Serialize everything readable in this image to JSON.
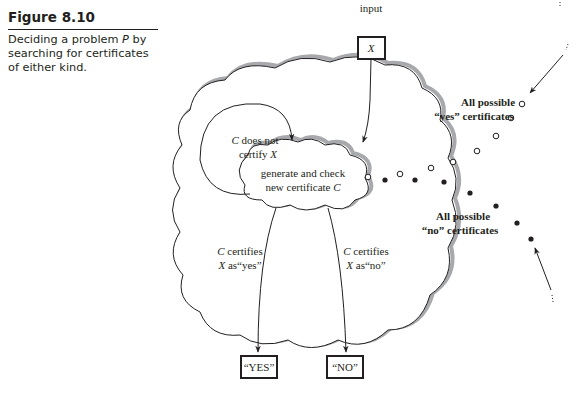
{
  "caption": {
    "title": "Figure 8.10",
    "description_pre": "Deciding a problem ",
    "description_var": "P",
    "description_post": " by searching for certificates of either kind."
  },
  "diagram": {
    "input_label": "input",
    "input_var": "X",
    "generator": {
      "line1": "generate and check",
      "line2_pre": "new certificate ",
      "line2_var": "C"
    },
    "loop_label": {
      "line1_var": "C",
      "line1_post": " does not",
      "line2_pre": "certify ",
      "line2_var": "X"
    },
    "yes_branch_label": {
      "line1_var": "C",
      "line1_post": " certifies",
      "line2_var": "X",
      "line2_post": " as“yes”"
    },
    "no_branch_label": {
      "line1_var": "C",
      "line1_post": " certifies",
      "line2_var": "X",
      "line2_post": " as“no”"
    },
    "yes_output": "“YES”",
    "no_output": "“NO”",
    "yes_set_label": [
      "All possible",
      "“yes” certificates"
    ],
    "no_set_label": [
      "All possible",
      "“no” certificates"
    ],
    "colors": {
      "ink": "#231f20",
      "shadow": "#a7a9ac"
    }
  }
}
